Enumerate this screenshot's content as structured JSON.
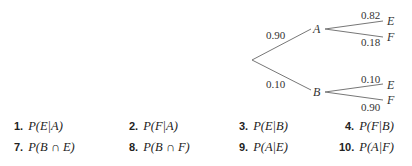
{
  "tree": {
    "first_stage": [
      {
        "node": "A",
        "probability": "0.90"
      },
      {
        "node": "B",
        "probability": "0.10"
      }
    ],
    "second_stage": {
      "A": [
        {
          "node": "E",
          "probability": "0.82"
        },
        {
          "node": "F",
          "probability": "0.18"
        }
      ],
      "B": [
        {
          "node": "E",
          "probability": "0.10"
        },
        {
          "node": "F",
          "probability": "0.90"
        }
      ]
    }
  },
  "exercises": [
    {
      "number": "1.",
      "expression": "P(E|A)"
    },
    {
      "number": "2.",
      "expression": "P(F|A)"
    },
    {
      "number": "3.",
      "expression": "P(E|B)"
    },
    {
      "number": "4.",
      "expression": "P(F|B)"
    },
    {
      "number": "7.",
      "expression": "P(B ∩ E)"
    },
    {
      "number": "8.",
      "expression": "P(B ∩ F)"
    },
    {
      "number": "9.",
      "expression": "P(A|E)"
    },
    {
      "number": "10.",
      "expression": "P(A|F)"
    }
  ]
}
